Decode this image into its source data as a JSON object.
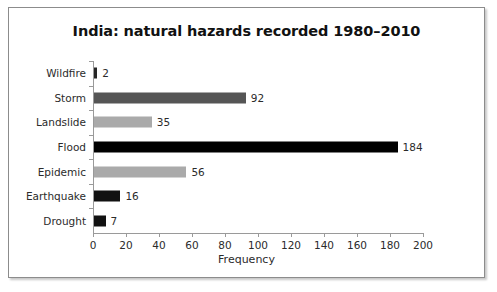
{
  "figure": {
    "background_color": "#ffffff",
    "frame_color": "#8c8c8c"
  },
  "chart_data": {
    "type": "bar",
    "orientation": "horizontal",
    "title": "India: natural hazards recorded 1980–2010",
    "xlabel": "Frequency",
    "ylabel": "",
    "categories": [
      "Wildfire",
      "Storm",
      "Landslide",
      "Flood",
      "Epidemic",
      "Earthquake",
      "Drought"
    ],
    "values": [
      2,
      92,
      35,
      184,
      56,
      16,
      7
    ],
    "bar_colors": [
      "#262626",
      "#555555",
      "#aaaaaa",
      "#000000",
      "#aaaaaa",
      "#111111",
      "#111111"
    ],
    "data_labels": [
      "2",
      "92",
      "35",
      "184",
      "56",
      "16",
      "7"
    ],
    "xlim": [
      0,
      200
    ],
    "xticks": [
      0,
      20,
      40,
      60,
      80,
      100,
      120,
      140,
      160,
      180,
      200
    ],
    "xtick_labels": [
      "0",
      "20",
      "40",
      "60",
      "80",
      "100",
      "120",
      "140",
      "160",
      "180",
      "200"
    ],
    "grid": false,
    "legend": null
  }
}
